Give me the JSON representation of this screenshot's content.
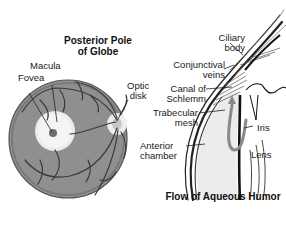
{
  "diagram": {
    "left_panel": {
      "title_line1": "Posterior Pole",
      "title_line2": "of Globe",
      "labels": {
        "macula": "Macula",
        "fovea": "Fovea",
        "optic_disk_line1": "Optic",
        "optic_disk_line2": "disk"
      }
    },
    "right_panel": {
      "title": "Flow of Aqueous Humor",
      "labels": {
        "ciliary_body_line1": "Ciliary",
        "ciliary_body_line2": "body",
        "conjunctival_veins_line1": "Conjunctival",
        "conjunctival_veins_line2": "veins",
        "canal_line1": "Canal of",
        "canal_line2": "Schlemm",
        "trabecular_line1": "Trabecular",
        "trabecular_line2": "mesh",
        "anterior_line1": "Anterior",
        "anterior_line2": "chamber",
        "iris": "Iris",
        "lens": "Lens"
      }
    },
    "colors": {
      "retina_fill": "#8c8c8c",
      "macula_fill": "#ececec",
      "fovea_fill": "#6e6e6e",
      "vessel": "#3a3a3a",
      "chamber_fill": "#ececec"
    }
  }
}
